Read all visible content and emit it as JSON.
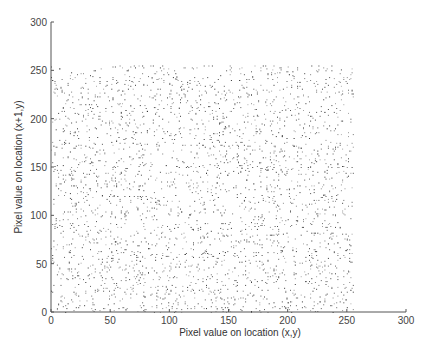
{
  "chart_data": {
    "type": "scatter",
    "title": "",
    "xlabel": "Pixel value on location (x,y)",
    "ylabel": "Pixel value on location (x+1,y)",
    "xlim": [
      0,
      300
    ],
    "ylim": [
      0,
      300
    ],
    "xticks": [
      0,
      50,
      100,
      150,
      200,
      250,
      300
    ],
    "yticks": [
      0,
      50,
      100,
      150,
      200,
      250,
      300
    ],
    "grid": false,
    "legend": null,
    "series": [
      {
        "name": "adjacent pixel pairs (horizontal)",
        "distribution": "uniform",
        "x_range": [
          0,
          255
        ],
        "y_range": [
          0,
          255
        ],
        "approx_point_count": 3000,
        "marker_color": "#222222",
        "seed": 12345
      }
    ],
    "annotations": []
  },
  "axes": {
    "x_tick_labels": [
      "0",
      "50",
      "100",
      "150",
      "200",
      "250",
      "300"
    ],
    "y_tick_labels": [
      "0",
      "50",
      "100",
      "150",
      "200",
      "250",
      "300"
    ],
    "x_label": "Pixel value on location (x,y)",
    "y_label": "Pixel value on location (x+1,y)"
  }
}
